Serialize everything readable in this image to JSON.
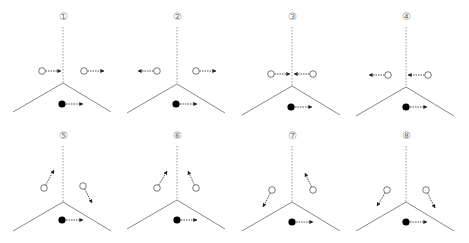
{
  "figure": {
    "colors": {
      "line": "#888888",
      "dashed": "#999999",
      "arrow": "#222222",
      "open_circle_stroke": "#555555",
      "filled_circle": "#000000",
      "label": "#777777"
    },
    "panels": [
      {
        "label": "①",
        "cx": 63,
        "top": 8,
        "junction_y": 83,
        "open": [
          {
            "x": 42,
            "y": 71,
            "tx": 61,
            "ty": 71
          },
          {
            "x": 84,
            "y": 71,
            "tx": 104,
            "ty": 71
          }
        ],
        "filled": {
          "x": 62,
          "y": 104,
          "tx": 83,
          "ty": 104
        }
      },
      {
        "label": "②",
        "cx": 177,
        "top": 8,
        "junction_y": 84,
        "open": [
          {
            "x": 157,
            "y": 71,
            "tx": 138,
            "ty": 71
          },
          {
            "x": 196,
            "y": 71,
            "tx": 216,
            "ty": 71
          }
        ],
        "filled": {
          "x": 176,
          "y": 104,
          "tx": 197,
          "ty": 104
        }
      },
      {
        "label": "③",
        "cx": 292,
        "top": 8,
        "junction_y": 86,
        "open": [
          {
            "x": 271,
            "y": 74,
            "tx": 290,
            "ty": 74
          },
          {
            "x": 313,
            "y": 74,
            "tx": 294,
            "ty": 74
          }
        ],
        "filled": {
          "x": 291,
          "y": 107,
          "tx": 312,
          "ty": 107
        }
      },
      {
        "label": "④",
        "cx": 406,
        "top": 8,
        "junction_y": 87,
        "open": [
          {
            "x": 388,
            "y": 75,
            "tx": 369,
            "ty": 75
          },
          {
            "x": 428,
            "y": 75,
            "tx": 408,
            "ty": 75
          }
        ],
        "filled": {
          "x": 406,
          "y": 107,
          "tx": 427,
          "ty": 107
        }
      },
      {
        "label": "⑤",
        "cx": 63,
        "top": 127,
        "junction_y": 202,
        "open": [
          {
            "x": 44,
            "y": 188,
            "tx": 54,
            "ty": 170
          },
          {
            "x": 83,
            "y": 186,
            "tx": 92,
            "ty": 203
          }
        ],
        "filled": {
          "x": 62,
          "y": 220,
          "tx": 83,
          "ty": 220
        }
      },
      {
        "label": "⑥",
        "cx": 177,
        "top": 127,
        "junction_y": 200,
        "open": [
          {
            "x": 157,
            "y": 188,
            "tx": 167,
            "ty": 171
          },
          {
            "x": 196,
            "y": 188,
            "tx": 188,
            "ty": 171
          }
        ],
        "filled": {
          "x": 177,
          "y": 220,
          "tx": 197,
          "ty": 220
        }
      },
      {
        "label": "⑦",
        "cx": 292,
        "top": 127,
        "junction_y": 202,
        "open": [
          {
            "x": 272,
            "y": 190,
            "tx": 263,
            "ty": 207
          },
          {
            "x": 313,
            "y": 190,
            "tx": 305,
            "ty": 173
          }
        ],
        "filled": {
          "x": 292,
          "y": 222,
          "tx": 313,
          "ty": 222
        }
      },
      {
        "label": "⑧",
        "cx": 406,
        "top": 127,
        "junction_y": 202,
        "open": [
          {
            "x": 387,
            "y": 190,
            "tx": 377,
            "ty": 206
          },
          {
            "x": 426,
            "y": 190,
            "tx": 435,
            "ty": 208
          }
        ],
        "filled": {
          "x": 406,
          "y": 222,
          "tx": 427,
          "ty": 222
        }
      }
    ]
  }
}
